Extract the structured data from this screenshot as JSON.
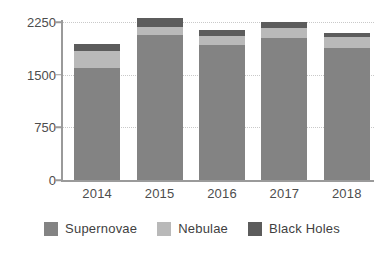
{
  "chart_data": {
    "type": "bar",
    "subtype": "stacked-bar",
    "title": "",
    "xlabel": "",
    "ylabel": "",
    "categories": [
      "2014",
      "2015",
      "2016",
      "2017",
      "2018"
    ],
    "series": [
      {
        "name": "Supernovae",
        "color": "#838383",
        "values": [
          1595,
          2065,
          1925,
          2020,
          1880
        ]
      },
      {
        "name": "Nebulae",
        "color": "#b9b9b9",
        "values": [
          240,
          115,
          125,
          145,
          155
        ]
      },
      {
        "name": "Black Holes",
        "color": "#5c5c5c",
        "values": [
          100,
          125,
          85,
          85,
          60
        ]
      }
    ],
    "totals": [
      1935,
      2305,
      2135,
      2250,
      2095
    ],
    "ylim": [
      0,
      2250
    ],
    "yticks": [
      0,
      750,
      1500,
      2250
    ],
    "ytick_labels": [
      "0",
      "750",
      "1500",
      "2250"
    ],
    "grid": true,
    "grid_style": "dotted-horizontal",
    "legend_position": "bottom",
    "stack_order_bottom_to_top": [
      "Supernovae",
      "Nebulae",
      "Black Holes"
    ]
  },
  "axis": {
    "y_labels": [
      "2250",
      "1500",
      "750",
      "0"
    ],
    "x_labels": [
      "2014",
      "2015",
      "2016",
      "2017",
      "2018"
    ]
  },
  "legend": {
    "items": [
      {
        "label": "Supernovae",
        "color": "#838383"
      },
      {
        "label": "Nebulae",
        "color": "#b9b9b9"
      },
      {
        "label": "Black Holes",
        "color": "#5c5c5c"
      }
    ]
  },
  "colors": {
    "supernovae": "#838383",
    "nebulae": "#b9b9b9",
    "black_holes": "#5c5c5c",
    "axis": "#9a9a9a",
    "grid": "#c9c9c9",
    "text": "#4d4d4d",
    "background": "#ffffff"
  }
}
